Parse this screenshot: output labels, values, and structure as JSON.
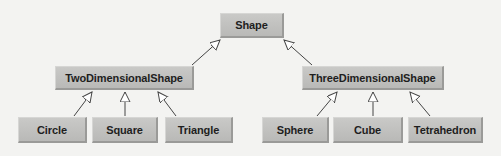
{
  "diagram": {
    "type": "uml-inheritance-hierarchy",
    "root": {
      "label": "Shape"
    },
    "level1": [
      {
        "label": "TwoDimensionalShape",
        "parent": "Shape"
      },
      {
        "label": "ThreeDimensionalShape",
        "parent": "Shape"
      }
    ],
    "level2": [
      {
        "label": "Circle",
        "parent": "TwoDimensionalShape"
      },
      {
        "label": "Square",
        "parent": "TwoDimensionalShape"
      },
      {
        "label": "Triangle",
        "parent": "TwoDimensionalShape"
      },
      {
        "label": "Sphere",
        "parent": "ThreeDimensionalShape"
      },
      {
        "label": "Cube",
        "parent": "ThreeDimensionalShape"
      },
      {
        "label": "Tetrahedron",
        "parent": "ThreeDimensionalShape"
      }
    ],
    "colors": {
      "background": "#f3f3f1",
      "box_fill": "#c0c0be",
      "box_shadow": "#9a9a98",
      "text": "#1e1e1e",
      "arrow": "#444444"
    }
  }
}
